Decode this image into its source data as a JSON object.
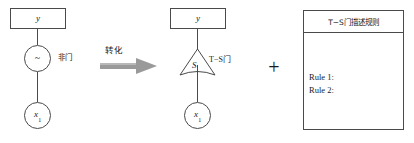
{
  "figure": {
    "left_diagram": {
      "output_box": {
        "label": "y",
        "kind": "box"
      },
      "gate_node": {
        "glyph": "~",
        "kind": "circle"
      },
      "gate_label": "非门",
      "input_node": {
        "label": "x",
        "subscript": "1",
        "kind": "circle"
      }
    },
    "transform": {
      "label": "转化",
      "arrow_icon": "right-block-arrow-icon",
      "arrow_color": "#9a9a9a"
    },
    "right_diagram": {
      "output_box": {
        "label": "y",
        "kind": "box"
      },
      "gate_node": {
        "glyph": "S",
        "kind": "triangle-concave-base"
      },
      "gate_label": "T−S门",
      "input_node": {
        "label": "x",
        "subscript": "1",
        "kind": "circle"
      }
    },
    "combiner": {
      "operator": "+"
    },
    "rules_panel": {
      "header": "T−S门描述规则",
      "rules": [
        "Rule 1:",
        "Rule 2:"
      ]
    },
    "colors": {
      "stroke": "#4a4a4a",
      "text": "#1a1a1a",
      "background": "#ffffff",
      "arrow": "#9a9a9a"
    }
  }
}
